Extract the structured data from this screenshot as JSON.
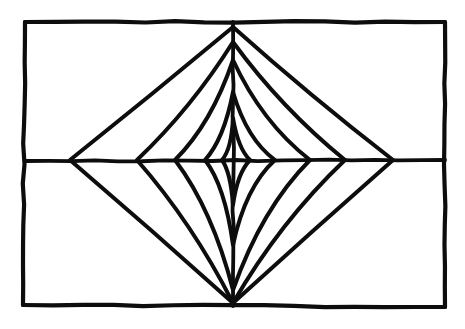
{
  "figure": {
    "style": {
      "ink_color": "#0d0d0d",
      "background_color": "#ffffff",
      "frame_stroke_width": 4.2,
      "axis_stroke_width": 3.8,
      "curve_stroke_width": 4.0,
      "hand_drawn": "true"
    },
    "canvas": {
      "width": 465,
      "height": 329
    }
  },
  "chart_data": {
    "type": "line",
    "xlabel": "",
    "ylabel": "",
    "xlim": [
      0,
      465
    ],
    "ylim": [
      0,
      329
    ],
    "grid": "off",
    "legend": "none",
    "annotations": [],
    "center": {
      "x": 233,
      "y": 161
    },
    "frame": {
      "name": "outer-rectangle",
      "corners": [
        {
          "x": 25,
          "y": 22
        },
        {
          "x": 445,
          "y": 22
        },
        {
          "x": 445,
          "y": 307
        },
        {
          "x": 23,
          "y": 305
        }
      ]
    },
    "axes": {
      "horizontal": {
        "x1": 25,
        "y1": 161,
        "x2": 445,
        "y2": 160
      },
      "vertical": {
        "x1": 233,
        "y1": 22,
        "x2": 233,
        "y2": 306
      }
    },
    "shared_vertices": {
      "top": {
        "x": 233,
        "y": 27
      },
      "bottom": {
        "x": 233,
        "y": 303
      }
    },
    "series": [
      {
        "name": "curve-1-outermost",
        "concavity": 0.02,
        "left_vertex": {
          "x": 70,
          "y": 160
        },
        "right_vertex": {
          "x": 393,
          "y": 160
        },
        "top_vertex": {
          "x": 233,
          "y": 27
        },
        "bottom_vertex": {
          "x": 233,
          "y": 303
        }
      },
      {
        "name": "curve-2",
        "concavity": 0.14,
        "left_vertex": {
          "x": 137,
          "y": 160
        },
        "right_vertex": {
          "x": 345,
          "y": 160
        },
        "top_vertex": {
          "x": 233,
          "y": 42
        },
        "bottom_vertex": {
          "x": 233,
          "y": 303
        }
      },
      {
        "name": "curve-3",
        "concavity": 0.26,
        "left_vertex": {
          "x": 175,
          "y": 160
        },
        "right_vertex": {
          "x": 310,
          "y": 160
        },
        "top_vertex": {
          "x": 233,
          "y": 60
        },
        "bottom_vertex": {
          "x": 233,
          "y": 290
        }
      },
      {
        "name": "curve-4",
        "concavity": 0.4,
        "left_vertex": {
          "x": 205,
          "y": 160
        },
        "right_vertex": {
          "x": 275,
          "y": 160
        },
        "top_vertex": {
          "x": 233,
          "y": 92
        },
        "bottom_vertex": {
          "x": 233,
          "y": 245
        }
      },
      {
        "name": "curve-5-innermost",
        "concavity": 0.5,
        "left_vertex": {
          "x": 222,
          "y": 160
        },
        "right_vertex": {
          "x": 250,
          "y": 160
        },
        "top_vertex": {
          "x": 233,
          "y": 118
        },
        "bottom_vertex": {
          "x": 233,
          "y": 205
        }
      }
    ]
  }
}
